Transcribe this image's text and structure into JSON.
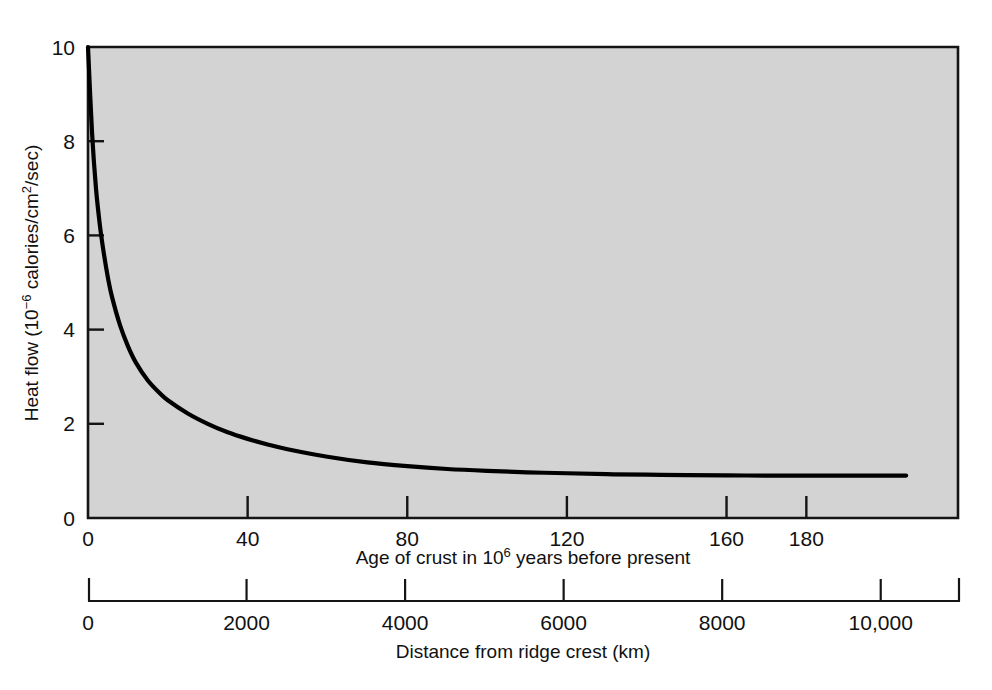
{
  "figure": {
    "background_color": "#ffffff",
    "plot_fill_color": "#d3d3d3",
    "axis_color": "#141414",
    "curve_color": "#000000"
  },
  "yaxis": {
    "title_main": "Heat flow (10",
    "title_sup": "−6",
    "title_mid": " calories/cm",
    "title_sup2": "2",
    "title_end": "/sec)",
    "ticks": [
      "0",
      "2",
      "4",
      "6",
      "8",
      "10"
    ],
    "range": [
      0,
      10
    ]
  },
  "xaxis_top": {
    "title_main": "Age of crust in 10",
    "title_sup": "6",
    "title_end": " years before present",
    "ticks": [
      "0",
      "40",
      "80",
      "120",
      "160",
      "180"
    ],
    "range": [
      0,
      218
    ]
  },
  "xaxis_bottom": {
    "title": "Distance from ridge crest (km)",
    "ticks": [
      "0",
      "2000",
      "4000",
      "6000",
      "8000",
      "10,000"
    ],
    "range": [
      0,
      11000
    ]
  },
  "chart_data": {
    "type": "line",
    "title": "",
    "xlabel": "Age of crust in 10^6 years before present",
    "ylabel": "Heat flow (10^-6 calories/cm^2/sec)",
    "xlim": [
      0,
      218
    ],
    "ylim": [
      0,
      10
    ],
    "grid": false,
    "legend": "none",
    "secondary_xaxis": {
      "label": "Distance from ridge crest (km)",
      "xlim": [
        0,
        11000
      ],
      "ticks": [
        0,
        2000,
        4000,
        6000,
        8000,
        10000
      ],
      "tick_labels": [
        "0",
        "2000",
        "4000",
        "6000",
        "8000",
        "10,000"
      ]
    },
    "xticks": [
      0,
      40,
      80,
      120,
      160,
      180
    ],
    "yticks": [
      0,
      2,
      4,
      6,
      8,
      10
    ],
    "series": [
      {
        "name": "Heat flow vs age of crust",
        "x": [
          0,
          1,
          2,
          3,
          4,
          5,
          6,
          8,
          10,
          12,
          15,
          18,
          20,
          25,
          30,
          35,
          40,
          45,
          50,
          60,
          70,
          80,
          90,
          100,
          110,
          120,
          130,
          140,
          150,
          160,
          170,
          180,
          190,
          200,
          205
        ],
        "y": [
          10.0,
          8.2,
          7.0,
          6.2,
          5.6,
          5.1,
          4.7,
          4.1,
          3.65,
          3.3,
          2.92,
          2.65,
          2.5,
          2.22,
          2.0,
          1.82,
          1.68,
          1.56,
          1.46,
          1.3,
          1.18,
          1.1,
          1.04,
          1.0,
          0.97,
          0.95,
          0.93,
          0.92,
          0.91,
          0.905,
          0.9,
          0.9,
          0.9,
          0.9,
          0.9
        ]
      }
    ],
    "asymptote_value": 0.9,
    "curve_start_value": 10.0,
    "curve_end_age": 205
  }
}
